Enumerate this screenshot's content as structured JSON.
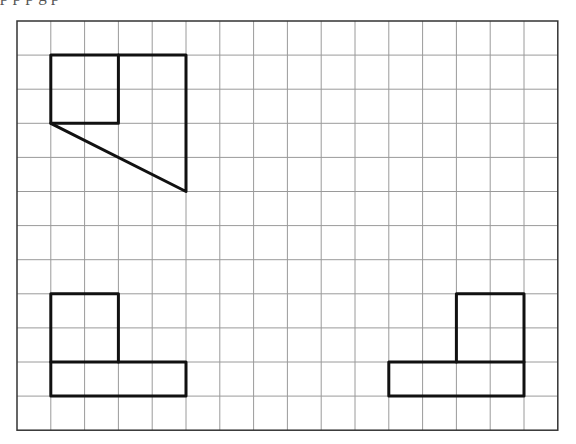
{
  "page": {
    "top_text_fragment": "p p                    p g                 p"
  },
  "grid": {
    "origin_x": 17,
    "origin_y": 21,
    "cols": 16,
    "rows": 12,
    "cell_w": 33.8,
    "cell_h": 34.1,
    "grid_color": "#9a9a9a",
    "border_color": "#333333",
    "shape_color": "#111111"
  },
  "shapes": [
    {
      "name": "top-left-figure-square",
      "type": "polyline",
      "points": [
        [
          1,
          1
        ],
        [
          3,
          1
        ],
        [
          3,
          3
        ],
        [
          1,
          3
        ],
        [
          1,
          1
        ]
      ]
    },
    {
      "name": "top-left-figure-outline",
      "type": "polyline",
      "points": [
        [
          3,
          1
        ],
        [
          5,
          1
        ],
        [
          5,
          5
        ],
        [
          1,
          3
        ]
      ]
    },
    {
      "name": "bottom-left-figure-square",
      "type": "polyline",
      "points": [
        [
          1,
          10
        ],
        [
          1,
          8
        ],
        [
          3,
          8
        ],
        [
          3,
          10
        ]
      ]
    },
    {
      "name": "bottom-left-figure-bar",
      "type": "polyline",
      "points": [
        [
          1,
          10
        ],
        [
          5,
          10
        ],
        [
          5,
          11
        ],
        [
          1,
          11
        ],
        [
          1,
          10
        ]
      ]
    },
    {
      "name": "bottom-right-figure-square",
      "type": "polyline",
      "points": [
        [
          13,
          10
        ],
        [
          13,
          8
        ],
        [
          15,
          8
        ],
        [
          15,
          10
        ]
      ]
    },
    {
      "name": "bottom-right-figure-bar",
      "type": "polyline",
      "points": [
        [
          11,
          10
        ],
        [
          15,
          10
        ],
        [
          15,
          11
        ],
        [
          11,
          11
        ],
        [
          11,
          10
        ]
      ]
    }
  ]
}
